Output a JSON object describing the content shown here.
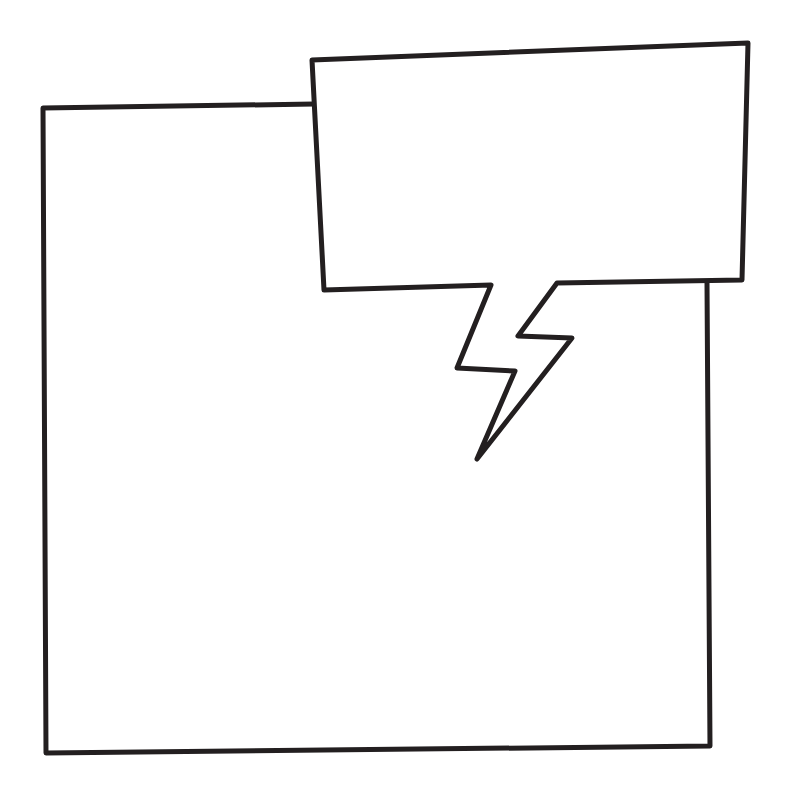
{
  "canvas": {
    "width": 790,
    "height": 810,
    "background": "#ffffff"
  },
  "style": {
    "stroke_color": "#231f20",
    "stroke_width": 5,
    "fill_color": "#ffffff"
  },
  "panel": {
    "label": "comic-panel",
    "points": "314,104 43,108 46,753 710,746 707,283"
  },
  "speech_bubble": {
    "label": "speech-bubble-lightning-tail",
    "points": "312,60 748,43 742,280 557,283 518,336 572,338 477,459 515,371 457,368 491,285 324,290"
  }
}
